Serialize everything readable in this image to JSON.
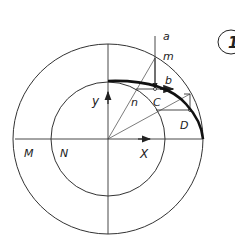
{
  "figure": {
    "labels": {
      "a": "a",
      "m": "m",
      "b": "b",
      "n": "n",
      "c": "C",
      "d": "D",
      "y": "y",
      "x": "X",
      "M": "M",
      "N": "N",
      "figure_number": "1"
    },
    "colors": {
      "stroke": "#333333",
      "ellipse_arc": "#111111",
      "background": "#ffffff"
    }
  }
}
